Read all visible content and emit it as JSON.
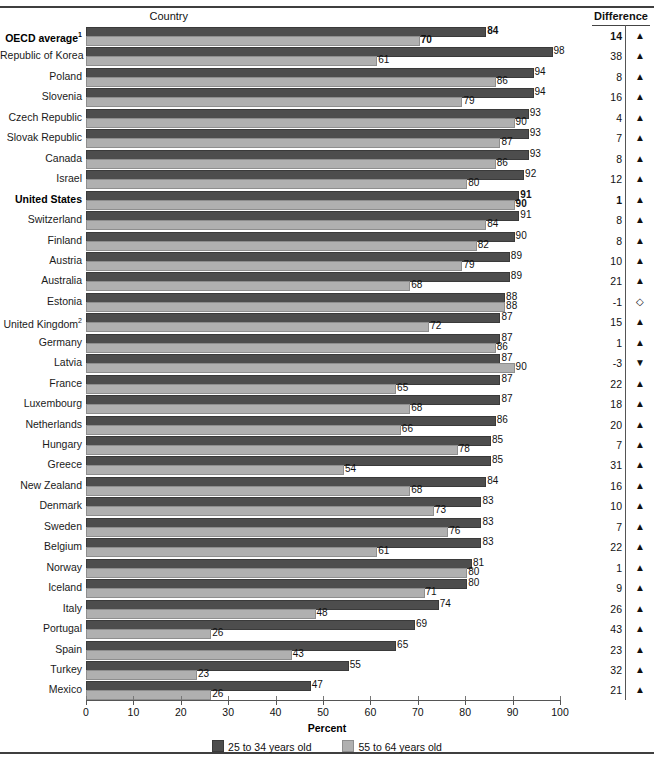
{
  "header": {
    "country_label": "Country",
    "difference_label": "Difference"
  },
  "axis": {
    "title": "Percent",
    "ticks": [
      0,
      10,
      20,
      30,
      40,
      50,
      60,
      70,
      80,
      90,
      100
    ],
    "min": 0,
    "max": 100
  },
  "legend": {
    "young_label": "25 to 34 years old",
    "old_label": "55 to 64 years old",
    "young_color": "#4d4d4d",
    "old_color": "#b0b0b0"
  },
  "markers": {
    "up": "▲",
    "down": "▼",
    "none": "◇"
  },
  "chart_data": {
    "type": "bar",
    "title": "",
    "xlabel": "Percent",
    "ylabel": "Country",
    "xlim": [
      0,
      100
    ],
    "orientation": "horizontal",
    "grid": false,
    "legend_position": "bottom",
    "categories": [
      "OECD average",
      "Republic of Korea",
      "Poland",
      "Slovenia",
      "Czech Republic",
      "Slovak Republic",
      "Canada",
      "Israel",
      "United States",
      "Switzerland",
      "Finland",
      "Austria",
      "Australia",
      "Estonia",
      "United Kingdom",
      "Germany",
      "Latvia",
      "France",
      "Luxembourg",
      "Netherlands",
      "Hungary",
      "Greece",
      "New Zealand",
      "Denmark",
      "Sweden",
      "Belgium",
      "Norway",
      "Iceland",
      "Italy",
      "Portugal",
      "Spain",
      "Turkey",
      "Mexico"
    ],
    "series": [
      {
        "name": "25 to 34 years old",
        "values": [
          84,
          98,
          94,
          94,
          93,
          93,
          93,
          92,
          91,
          91,
          90,
          89,
          89,
          88,
          87,
          87,
          87,
          87,
          87,
          86,
          85,
          85,
          84,
          83,
          83,
          83,
          81,
          80,
          74,
          69,
          65,
          55,
          47
        ]
      },
      {
        "name": "55 to 64 years old",
        "values": [
          70,
          61,
          86,
          79,
          90,
          87,
          86,
          80,
          90,
          84,
          82,
          79,
          68,
          88,
          72,
          86,
          90,
          65,
          68,
          66,
          78,
          54,
          68,
          73,
          76,
          61,
          80,
          71,
          48,
          26,
          43,
          23,
          26
        ]
      }
    ],
    "difference": [
      14,
      38,
      8,
      16,
      4,
      7,
      8,
      12,
      1,
      8,
      8,
      10,
      21,
      -1,
      15,
      1,
      -3,
      22,
      18,
      20,
      7,
      31,
      16,
      10,
      7,
      22,
      1,
      9,
      26,
      43,
      23,
      32,
      21
    ],
    "difference_marker": [
      "up",
      "up",
      "up",
      "up",
      "up",
      "up",
      "up",
      "up",
      "up",
      "up",
      "up",
      "up",
      "up",
      "none",
      "up",
      "up",
      "down",
      "up",
      "up",
      "up",
      "up",
      "up",
      "up",
      "up",
      "up",
      "up",
      "up",
      "up",
      "up",
      "up",
      "up",
      "up",
      "up"
    ]
  },
  "rows": [
    {
      "label": "OECD average",
      "sup": "1",
      "bold": true,
      "young": 84,
      "old": 70,
      "diff": "14",
      "marker": "up"
    },
    {
      "label": "Republic of Korea",
      "sup": "",
      "bold": false,
      "young": 98,
      "old": 61,
      "diff": "38",
      "marker": "up"
    },
    {
      "label": "Poland",
      "sup": "",
      "bold": false,
      "young": 94,
      "old": 86,
      "diff": "8",
      "marker": "up"
    },
    {
      "label": "Slovenia",
      "sup": "",
      "bold": false,
      "young": 94,
      "old": 79,
      "diff": "16",
      "marker": "up"
    },
    {
      "label": "Czech Republic",
      "sup": "",
      "bold": false,
      "young": 93,
      "old": 90,
      "diff": "4",
      "marker": "up"
    },
    {
      "label": "Slovak Republic",
      "sup": "",
      "bold": false,
      "young": 93,
      "old": 87,
      "diff": "7",
      "marker": "up"
    },
    {
      "label": "Canada",
      "sup": "",
      "bold": false,
      "young": 93,
      "old": 86,
      "diff": "8",
      "marker": "up"
    },
    {
      "label": "Israel",
      "sup": "",
      "bold": false,
      "young": 92,
      "old": 80,
      "diff": "12",
      "marker": "up"
    },
    {
      "label": "United States",
      "sup": "",
      "bold": true,
      "young": 91,
      "old": 90,
      "diff": "1",
      "marker": "up"
    },
    {
      "label": "Switzerland",
      "sup": "",
      "bold": false,
      "young": 91,
      "old": 84,
      "diff": "8",
      "marker": "up"
    },
    {
      "label": "Finland",
      "sup": "",
      "bold": false,
      "young": 90,
      "old": 82,
      "diff": "8",
      "marker": "up"
    },
    {
      "label": "Austria",
      "sup": "",
      "bold": false,
      "young": 89,
      "old": 79,
      "diff": "10",
      "marker": "up"
    },
    {
      "label": "Australia",
      "sup": "",
      "bold": false,
      "young": 89,
      "old": 68,
      "diff": "21",
      "marker": "up"
    },
    {
      "label": "Estonia",
      "sup": "",
      "bold": false,
      "young": 88,
      "old": 88,
      "diff": "-1",
      "marker": "none"
    },
    {
      "label": "United Kingdom",
      "sup": "2",
      "bold": false,
      "young": 87,
      "old": 72,
      "diff": "15",
      "marker": "up"
    },
    {
      "label": "Germany",
      "sup": "",
      "bold": false,
      "young": 87,
      "old": 86,
      "diff": "1",
      "marker": "up"
    },
    {
      "label": "Latvia",
      "sup": "",
      "bold": false,
      "young": 87,
      "old": 90,
      "diff": "-3",
      "marker": "down"
    },
    {
      "label": "France",
      "sup": "",
      "bold": false,
      "young": 87,
      "old": 65,
      "diff": "22",
      "marker": "up"
    },
    {
      "label": "Luxembourg",
      "sup": "",
      "bold": false,
      "young": 87,
      "old": 68,
      "diff": "18",
      "marker": "up"
    },
    {
      "label": "Netherlands",
      "sup": "",
      "bold": false,
      "young": 86,
      "old": 66,
      "diff": "20",
      "marker": "up"
    },
    {
      "label": "Hungary",
      "sup": "",
      "bold": false,
      "young": 85,
      "old": 78,
      "diff": "7",
      "marker": "up"
    },
    {
      "label": "Greece",
      "sup": "",
      "bold": false,
      "young": 85,
      "old": 54,
      "diff": "31",
      "marker": "up"
    },
    {
      "label": "New Zealand",
      "sup": "",
      "bold": false,
      "young": 84,
      "old": 68,
      "diff": "16",
      "marker": "up"
    },
    {
      "label": "Denmark",
      "sup": "",
      "bold": false,
      "young": 83,
      "old": 73,
      "diff": "10",
      "marker": "up"
    },
    {
      "label": "Sweden",
      "sup": "",
      "bold": false,
      "young": 83,
      "old": 76,
      "diff": "7",
      "marker": "up"
    },
    {
      "label": "Belgium",
      "sup": "",
      "bold": false,
      "young": 83,
      "old": 61,
      "diff": "22",
      "marker": "up"
    },
    {
      "label": "Norway",
      "sup": "",
      "bold": false,
      "young": 81,
      "old": 80,
      "diff": "1",
      "marker": "up"
    },
    {
      "label": "Iceland",
      "sup": "",
      "bold": false,
      "young": 80,
      "old": 71,
      "diff": "9",
      "marker": "up"
    },
    {
      "label": "Italy",
      "sup": "",
      "bold": false,
      "young": 74,
      "old": 48,
      "diff": "26",
      "marker": "up"
    },
    {
      "label": "Portugal",
      "sup": "",
      "bold": false,
      "young": 69,
      "old": 26,
      "diff": "43",
      "marker": "up"
    },
    {
      "label": "Spain",
      "sup": "",
      "bold": false,
      "young": 65,
      "old": 43,
      "diff": "23",
      "marker": "up"
    },
    {
      "label": "Turkey",
      "sup": "",
      "bold": false,
      "young": 55,
      "old": 23,
      "diff": "32",
      "marker": "up"
    },
    {
      "label": "Mexico",
      "sup": "",
      "bold": false,
      "young": 47,
      "old": 26,
      "diff": "21",
      "marker": "up"
    }
  ]
}
